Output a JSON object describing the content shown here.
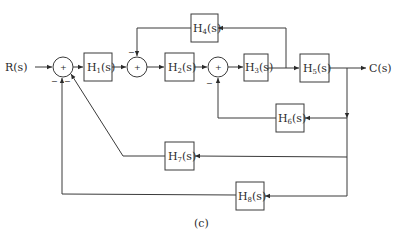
{
  "diagram": {
    "input_label": "R(s)",
    "output_label": "C(s)",
    "caption": "(c)",
    "summers": [
      {
        "id": "s1",
        "sign_inner": "+",
        "minus_labels": [
          "−",
          "−"
        ]
      },
      {
        "id": "s2",
        "sign_inner": "+",
        "minus_labels": [
          "−"
        ]
      },
      {
        "id": "s3",
        "sign_inner": "+",
        "minus_labels": [
          "−"
        ]
      }
    ],
    "blocks": [
      {
        "id": "H1",
        "base": "H",
        "sub": "1",
        "arg": "(s)"
      },
      {
        "id": "H2",
        "base": "H",
        "sub": "2",
        "arg": "(s)"
      },
      {
        "id": "H3",
        "base": "H",
        "sub": "3",
        "arg": "(s)"
      },
      {
        "id": "H4",
        "base": "H",
        "sub": "4",
        "arg": "(s)"
      },
      {
        "id": "H5",
        "base": "H",
        "sub": "5",
        "arg": "(s)"
      },
      {
        "id": "H6",
        "base": "H",
        "sub": "6",
        "arg": "(s)"
      },
      {
        "id": "H7",
        "base": "H",
        "sub": "7",
        "arg": "(s)"
      },
      {
        "id": "H8",
        "base": "H",
        "sub": "8",
        "arg": "(s)"
      }
    ],
    "colors": {
      "stroke": "#3a3a3a",
      "text": "#2b2b2b",
      "background": "#ffffff"
    }
  }
}
